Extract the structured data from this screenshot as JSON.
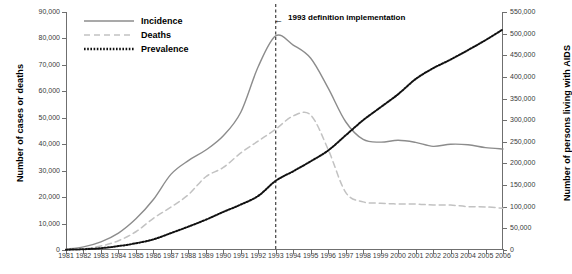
{
  "chart_data": {
    "type": "line",
    "title": "",
    "xlabel": "",
    "ylabel": "Number of cases or deaths",
    "y2label": "Number of persons living with AIDS",
    "x": [
      1981,
      1982,
      1983,
      1984,
      1985,
      1986,
      1987,
      1988,
      1989,
      1990,
      1991,
      1992,
      1993,
      1994,
      1995,
      1996,
      1997,
      1998,
      1999,
      2000,
      2001,
      2002,
      2003,
      2004,
      2005,
      2006
    ],
    "xlim": [
      1981,
      2006
    ],
    "ylim": [
      0,
      90000
    ],
    "y2lim": [
      0,
      550000
    ],
    "grid": false,
    "legend_position": "top-left",
    "series": [
      {
        "name": "Incidence",
        "axis": "left",
        "style": "solid",
        "color": "#8c8c8c",
        "values": [
          320,
          1200,
          3100,
          6400,
          11800,
          19100,
          28600,
          33800,
          37800,
          43200,
          52100,
          69400,
          81000,
          77500,
          72500,
          61200,
          48500,
          41800,
          40800,
          41500,
          40700,
          39200,
          40000,
          39800,
          38700,
          38200
        ]
      },
      {
        "name": "Deaths",
        "axis": "left",
        "style": "dashed",
        "color": "#c2c2c2",
        "values": [
          130,
          450,
          1500,
          3500,
          6900,
          12000,
          16200,
          20900,
          27700,
          31200,
          36700,
          41200,
          45700,
          50700,
          51000,
          38000,
          21800,
          18200,
          17700,
          17400,
          17400,
          17000,
          17000,
          16400,
          16300,
          15800
        ]
      },
      {
        "name": "Prevalence",
        "axis": "right",
        "style": "dotted",
        "color": "#111111",
        "values": [
          600,
          1800,
          4200,
          9000,
          15500,
          24500,
          39000,
          54000,
          70000,
          88000,
          105000,
          125000,
          160000,
          182000,
          205000,
          230000,
          265000,
          300000,
          330000,
          360000,
          395000,
          420000,
          440000,
          462000,
          485000,
          510000
        ]
      }
    ],
    "annotations": [
      {
        "label": "1993 definition implementation",
        "x": 1993,
        "marker": "vertical-dashed-line",
        "arrow": "←"
      }
    ],
    "y_ticks": [
      "0",
      "10,000",
      "20,000",
      "30,000",
      "40,000",
      "50,000",
      "60,000",
      "70,000",
      "80,000",
      "90,000"
    ],
    "y2_ticks": [
      "0",
      "50,000",
      "100,000",
      "150,000",
      "200,000",
      "250,000",
      "300,000",
      "350,000",
      "400,000",
      "450,000",
      "500,000",
      "550,000"
    ],
    "x_ticks": [
      "1981",
      "1982",
      "1983",
      "1984",
      "1985",
      "1986",
      "1987",
      "1988",
      "1989",
      "1990",
      "1991",
      "1992",
      "1993",
      "1994",
      "1995",
      "1996",
      "1997",
      "1998",
      "1999",
      "2000",
      "2001",
      "2002",
      "2003",
      "2004",
      "2005",
      "2006"
    ]
  }
}
